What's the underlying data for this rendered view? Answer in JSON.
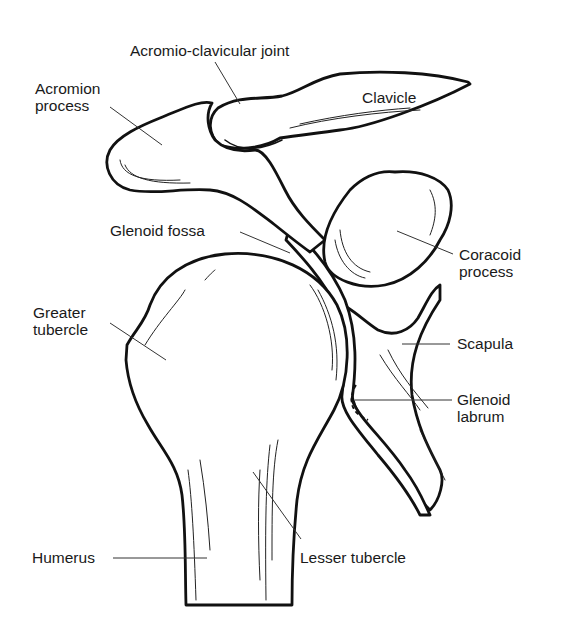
{
  "diagram": {
    "labels": [
      {
        "id": "acromio_clavicular_joint",
        "text": "Acromio-clavicular joint",
        "x": 130,
        "y": 42
      },
      {
        "id": "acromion_process",
        "text": "Acromion\nprocess",
        "x": 35,
        "y": 80
      },
      {
        "id": "clavicle",
        "text": "Clavicle",
        "x": 362,
        "y": 89
      },
      {
        "id": "glenoid_fossa",
        "text": "Glenoid fossa",
        "x": 110,
        "y": 222
      },
      {
        "id": "coracoid_process",
        "text": "Coracoid\nprocess",
        "x": 459,
        "y": 246
      },
      {
        "id": "greater_tubercle",
        "text": "Greater\ntubercle",
        "x": 33,
        "y": 304
      },
      {
        "id": "scapula",
        "text": "Scapula",
        "x": 457,
        "y": 335
      },
      {
        "id": "glenoid_labrum",
        "text": "Glenoid\nlabrum",
        "x": 457,
        "y": 391
      },
      {
        "id": "humerus",
        "text": "Humerus",
        "x": 32,
        "y": 549
      },
      {
        "id": "lesser_tubercle",
        "text": "Lesser tubercle",
        "x": 300,
        "y": 549
      }
    ],
    "leaders": [
      {
        "for": "acromio_clavicular_joint",
        "x1": 215,
        "y1": 62,
        "x2": 240,
        "y2": 104
      },
      {
        "for": "acromion_process",
        "x1": 110,
        "y1": 107,
        "x2": 162,
        "y2": 145
      },
      {
        "for": "glenoid_fossa",
        "x1": 240,
        "y1": 232,
        "x2": 290,
        "y2": 253
      },
      {
        "for": "coracoid_process",
        "x1": 397,
        "y1": 231,
        "x2": 453,
        "y2": 254
      },
      {
        "for": "greater_tubercle",
        "x1": 110,
        "y1": 323,
        "x2": 166,
        "y2": 360
      },
      {
        "for": "scapula",
        "x1": 402,
        "y1": 344,
        "x2": 450,
        "y2": 344
      },
      {
        "for": "glenoid_labrum",
        "x1": 355,
        "y1": 400,
        "x2": 452,
        "y2": 400
      },
      {
        "for": "humerus",
        "x1": 113,
        "y1": 558,
        "x2": 207,
        "y2": 558
      },
      {
        "for": "lesser_tubercle",
        "x1": 253,
        "y1": 472,
        "x2": 301,
        "y2": 539
      }
    ]
  }
}
